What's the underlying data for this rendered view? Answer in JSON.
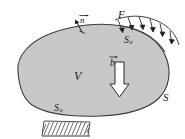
{
  "figure": {
    "background_color": "#ffffff",
    "body_fill_color": "#c8c8c8",
    "outline_color": "#3c3c3c",
    "label_color": "#1a1a1a"
  },
  "labels": {
    "volume": "V",
    "surface": "S",
    "traction_load": "F",
    "body_force": "b",
    "normal_vector": "n",
    "traction_surface_base": "S",
    "traction_surface_sub": "σ",
    "displacement_surface_base": "S",
    "displacement_surface_sub": "u"
  },
  "elements": {
    "body_outline_name": "continuum-body-blob",
    "body_force_arrow_name": "body-force-arrow",
    "normal_arrow_name": "outward-normal-arrow",
    "traction_arrows_name": "distributed-traction-arrows",
    "traction_arrow_count": 6,
    "support_hatching_name": "fixed-support-hatching",
    "support_hatch_line_count": 13
  }
}
